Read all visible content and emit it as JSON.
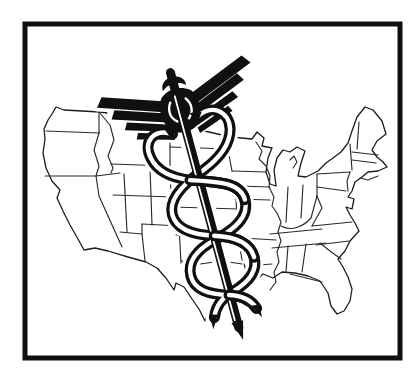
{
  "artwork": {
    "description": "Black and white clip-art illustration: outline map of the continental United States with state borders, overlaid at center by a large tilted caduceus medical symbol (winged staff entwined by two snakes), enclosed in a thick black rectangular frame on white paper",
    "subject": "caduceus-over-us-map",
    "elements": {
      "frame": "thick black rectangular border",
      "map": "continental United States outline with state borders and Great Lakes",
      "symbol": "caduceus: winged staff with pommel, two entwined snakes, pointed tip"
    },
    "palette": {
      "ink": "#101010",
      "paper": "#ffffff",
      "map_line": "#2a2a2a"
    }
  }
}
